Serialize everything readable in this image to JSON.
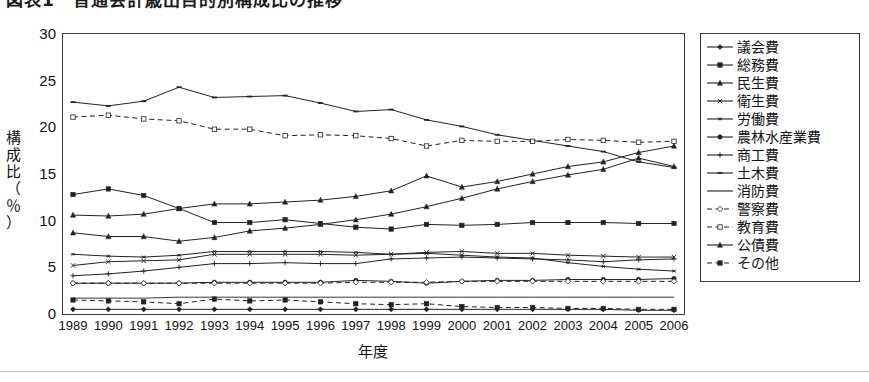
{
  "title": {
    "text": "図表1　普通会計歳出目的別構成比の推移",
    "note": "cut off at top edge of screenshot"
  },
  "axes": {
    "y_label_lines": [
      "構",
      "成",
      "比",
      "（",
      "％",
      "）"
    ],
    "y_label_text": "構成比（％）",
    "y_ticks": [
      0,
      5,
      10,
      15,
      20,
      25,
      30
    ],
    "ylim": [
      0,
      30
    ],
    "x_title": "年度",
    "x_ticks": [
      "1989",
      "1990",
      "1991",
      "1992",
      "1993",
      "1994",
      "1995",
      "1996",
      "1997",
      "1998",
      "1999",
      "2000",
      "2001",
      "2002",
      "2003",
      "2004",
      "2005",
      "2006"
    ]
  },
  "legend": {
    "position": "right",
    "items": [
      {
        "label": "議会費",
        "marker": "diamond",
        "dash": false
      },
      {
        "label": "総務費",
        "marker": "square",
        "dash": false
      },
      {
        "label": "民生費",
        "marker": "triangle",
        "dash": false
      },
      {
        "label": "衛生費",
        "marker": "cross",
        "dash": false
      },
      {
        "label": "労働費",
        "marker": "star",
        "dash": false
      },
      {
        "label": "農林水産業費",
        "marker": "circle",
        "dash": false
      },
      {
        "label": "商工費",
        "marker": "plus",
        "dash": false
      },
      {
        "label": "土木費",
        "marker": "dash",
        "dash": false
      },
      {
        "label": "消防費",
        "marker": "none",
        "dash": false
      },
      {
        "label": "警察費",
        "marker": "opendiamond",
        "dash": true
      },
      {
        "label": "教育費",
        "marker": "opensquare",
        "dash": true
      },
      {
        "label": "公債費",
        "marker": "triangle",
        "dash": false
      },
      {
        "label": "その他",
        "marker": "square",
        "dash": true
      }
    ]
  },
  "chart_data": {
    "type": "line",
    "title": "図表1　普通会計歳出目的別構成比の推移",
    "xlabel": "年度",
    "ylabel": "構成比（％）",
    "ylim": [
      0,
      30
    ],
    "ytick_step": 5,
    "grid": false,
    "legend_position": "right",
    "categories": [
      "1989",
      "1990",
      "1991",
      "1992",
      "1993",
      "1994",
      "1995",
      "1996",
      "1997",
      "1998",
      "1999",
      "2000",
      "2001",
      "2002",
      "2003",
      "2004",
      "2005",
      "2006"
    ],
    "series": [
      {
        "name": "議会費",
        "marker": "diamond",
        "dash": false,
        "color": "#222222",
        "values": [
          0.5,
          0.5,
          0.5,
          0.5,
          0.5,
          0.5,
          0.5,
          0.5,
          0.5,
          0.5,
          0.5,
          0.5,
          0.5,
          0.5,
          0.5,
          0.5,
          0.4,
          0.4
        ]
      },
      {
        "name": "総務費",
        "marker": "square",
        "dash": false,
        "color": "#222222",
        "values": [
          12.8,
          13.4,
          12.7,
          11.3,
          9.8,
          9.8,
          10.1,
          9.7,
          9.3,
          9.1,
          9.6,
          9.5,
          9.6,
          9.8,
          9.8,
          9.8,
          9.7,
          9.7
        ]
      },
      {
        "name": "民生費",
        "marker": "triangle",
        "dash": false,
        "color": "#222222",
        "values": [
          10.6,
          10.5,
          10.7,
          11.3,
          11.8,
          11.8,
          12.0,
          12.2,
          12.6,
          13.2,
          14.8,
          13.6,
          14.2,
          15.0,
          15.8,
          16.3,
          17.3,
          18.0
        ]
      },
      {
        "name": "衛生費",
        "marker": "cross",
        "dash": false,
        "color": "#222222",
        "values": [
          5.2,
          5.6,
          5.7,
          5.8,
          6.4,
          6.4,
          6.4,
          6.4,
          6.3,
          6.4,
          6.6,
          6.7,
          6.5,
          6.5,
          6.3,
          6.2,
          6.1,
          6.1
        ]
      },
      {
        "name": "労働費",
        "marker": "star",
        "dash": false,
        "color": "#222222",
        "values": [
          6.4,
          6.2,
          6.1,
          6.3,
          6.7,
          6.7,
          6.7,
          6.7,
          6.6,
          6.4,
          6.5,
          6.3,
          6.1,
          6.0,
          5.5,
          5.1,
          4.8,
          4.6
        ]
      },
      {
        "name": "農林水産業費",
        "marker": "circle",
        "dash": false,
        "color": "#222222",
        "values": [
          3.3,
          3.3,
          3.3,
          3.3,
          3.4,
          3.4,
          3.4,
          3.4,
          3.6,
          3.5,
          3.3,
          3.5,
          3.6,
          3.6,
          3.7,
          3.7,
          3.7,
          3.8
        ]
      },
      {
        "name": "商工費",
        "marker": "plus",
        "dash": false,
        "color": "#222222",
        "values": [
          4.1,
          4.3,
          4.6,
          5.0,
          5.4,
          5.4,
          5.5,
          5.4,
          5.4,
          5.9,
          6.0,
          6.1,
          6.0,
          5.9,
          5.8,
          5.6,
          5.8,
          5.9
        ]
      },
      {
        "name": "土木費",
        "marker": "dash",
        "dash": false,
        "color": "#222222",
        "values": [
          22.7,
          22.3,
          22.8,
          24.3,
          23.2,
          23.3,
          23.4,
          22.6,
          21.7,
          21.9,
          20.8,
          20.1,
          19.2,
          18.6,
          18.0,
          17.4,
          16.3,
          15.7
        ]
      },
      {
        "name": "消防費",
        "marker": "none",
        "dash": false,
        "color": "#222222",
        "values": [
          1.7,
          1.7,
          1.7,
          1.8,
          1.8,
          1.8,
          1.8,
          1.8,
          1.8,
          1.8,
          1.8,
          1.8,
          1.8,
          1.8,
          1.8,
          1.8,
          1.8,
          1.8
        ]
      },
      {
        "name": "警察費",
        "marker": "opendiamond",
        "dash": true,
        "color": "#222222",
        "values": [
          3.3,
          3.3,
          3.3,
          3.3,
          3.3,
          3.3,
          3.3,
          3.3,
          3.4,
          3.4,
          3.4,
          3.5,
          3.5,
          3.5,
          3.5,
          3.5,
          3.5,
          3.5
        ]
      },
      {
        "name": "教育費",
        "marker": "opensquare",
        "dash": true,
        "color": "#222222",
        "values": [
          21.1,
          21.3,
          20.9,
          20.7,
          19.8,
          19.8,
          19.1,
          19.2,
          19.1,
          18.8,
          18.0,
          18.6,
          18.5,
          18.5,
          18.7,
          18.6,
          18.4,
          18.5
        ]
      },
      {
        "name": "公債費",
        "marker": "triangle",
        "dash": false,
        "color": "#222222",
        "values": [
          8.7,
          8.3,
          8.3,
          7.8,
          8.2,
          8.9,
          9.2,
          9.6,
          10.1,
          10.7,
          11.5,
          12.4,
          13.4,
          14.2,
          14.9,
          15.5,
          16.7,
          15.8
        ]
      },
      {
        "name": "その他",
        "marker": "square",
        "dash": true,
        "color": "#222222",
        "values": [
          1.5,
          1.4,
          1.3,
          1.1,
          1.6,
          1.4,
          1.5,
          1.3,
          1.1,
          1.0,
          1.1,
          0.8,
          0.7,
          0.7,
          0.6,
          0.6,
          0.5,
          0.5
        ]
      }
    ]
  }
}
